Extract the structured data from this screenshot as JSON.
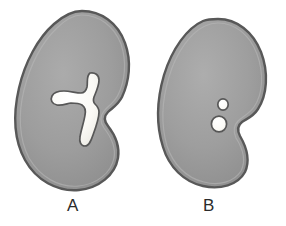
{
  "figure": {
    "background_color": "#ffffff",
    "width": 286,
    "height": 226,
    "panels": [
      {
        "id": "A",
        "label": "A",
        "organ": "kidney",
        "outline_color": "#5a5a5a",
        "fill_color": "#9b9b9b",
        "cavity_color": "#fbfbf8",
        "cavity_shape": "branched-y-shaped-cavity",
        "cavity_count": 1,
        "description": "Bean-shaped organ with a single branching Y-shaped white internal cavity"
      },
      {
        "id": "B",
        "label": "B",
        "organ": "kidney",
        "outline_color": "#5a5a5a",
        "fill_color": "#9b9b9b",
        "cavity_color": "#fbfbf8",
        "cavity_shape": "two-round-cavities",
        "cavity_count": 2,
        "description": "Bean-shaped organ with two separate round white internal cavities"
      }
    ]
  },
  "colors": {
    "outline": "#5a5a5a",
    "fill_light": "#a8a8a8",
    "fill_mid": "#9b9b9b",
    "fill_dark": "#8c8c8c",
    "cavity": "#fbfbf8",
    "label_text": "#2b2b2b",
    "background": "#ffffff"
  }
}
